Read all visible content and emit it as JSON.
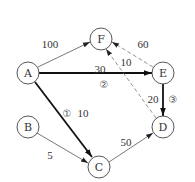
{
  "nodes": [
    {
      "id": "A",
      "label": "A",
      "x": 28,
      "y": 73
    },
    {
      "id": "B",
      "label": "B",
      "x": 28,
      "y": 127
    },
    {
      "id": "C",
      "label": "C",
      "x": 99,
      "y": 167
    },
    {
      "id": "D",
      "label": "D",
      "x": 163,
      "y": 127
    },
    {
      "id": "E",
      "label": "E",
      "x": 163,
      "y": 73
    },
    {
      "id": "F",
      "label": "F",
      "x": 101,
      "y": 39
    }
  ],
  "edges": [
    {
      "from": "A",
      "to": "F",
      "weight": "100",
      "style": "thin"
    },
    {
      "from": "A",
      "to": "E",
      "weight": "30",
      "style": "bold",
      "order": "②"
    },
    {
      "from": "A",
      "to": "C",
      "weight": "10",
      "style": "bold",
      "order": "①"
    },
    {
      "from": "B",
      "to": "C",
      "weight": "5",
      "style": "thin"
    },
    {
      "from": "C",
      "to": "D",
      "weight": "50",
      "style": "thin"
    },
    {
      "from": "E",
      "to": "D",
      "weight": "20",
      "style": "bold",
      "order": "③"
    },
    {
      "from": "E",
      "to": "F",
      "weight": "60",
      "style": "dashed"
    },
    {
      "from": "D",
      "to": "F",
      "weight": "10",
      "style": "dashed"
    }
  ],
  "labels": {
    "w_AF": "100",
    "w_AE": "30",
    "o_AE": "②",
    "w_AC": "10",
    "o_AC": "①",
    "w_BC": "5",
    "w_CD": "50",
    "w_ED": "20",
    "o_ED": "③",
    "w_EF": "60",
    "w_DF": "10"
  }
}
